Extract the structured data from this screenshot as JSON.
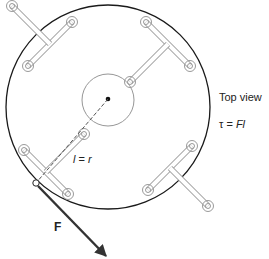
{
  "labels": {
    "view": "Top view",
    "torque_prefix": "τ = ",
    "torque_var": "Fl",
    "lever_var": "l",
    "lever_eq": " = ",
    "lever_r": "r",
    "force": "F"
  },
  "colors": {
    "outline": "#1a1a1a",
    "slot": "#9a9a9a",
    "hub": "#8a8a8a",
    "arrow": "#333333"
  },
  "geometry": {
    "outer_circle": {
      "cx": 108,
      "cy": 107,
      "r": 102
    },
    "hub_circle": {
      "cx": 108,
      "cy": 100,
      "r": 26
    },
    "application_point": {
      "x": 36,
      "y": 183
    },
    "arrow_tip": {
      "x": 107,
      "y": 257
    }
  }
}
